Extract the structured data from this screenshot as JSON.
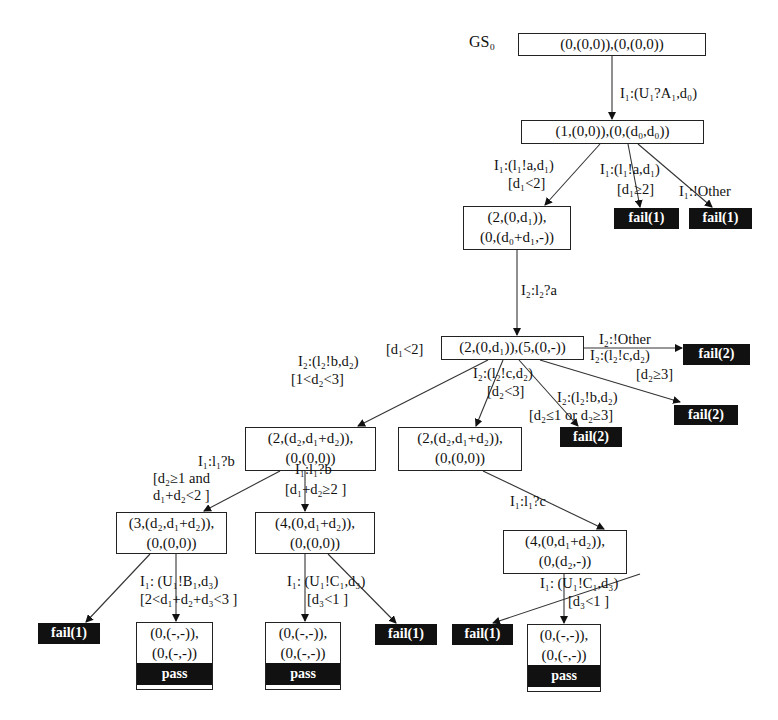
{
  "diagram": {
    "root_label": "GS₀",
    "nodes": {
      "n0": [
        "(0,(0,0)),(0,(0,0))"
      ],
      "n1": [
        "(1,(0,0)),(0,(d₀,d₀))"
      ],
      "n2": [
        "(2,(0,d₁)),",
        "(0,(d₀+d₁,-))"
      ],
      "n3": [
        "(2,(0,d₁)),(5,(0,-))"
      ],
      "n4": [
        "(2,(d₂,d₁+d₂)),",
        "(0,(0,0))"
      ],
      "n5": [
        "(2,(d₂,d₁+d₂)),",
        "(0,(0,0))"
      ],
      "n6": [
        "(3,(d₂,d₁+d₂)),",
        "(0,(0,0))"
      ],
      "n7": [
        "(4,(0,d₁+d₂)),",
        "(0,(0,0))"
      ],
      "n8": [
        "(4,(0,d₁+d₂)),",
        "(0,(d₂,-))"
      ]
    },
    "pass_nodes": [
      {
        "lines": [
          "(0,(-,-)),",
          "(0,(-,-))"
        ],
        "verdict": "pass"
      },
      {
        "lines": [
          "(0,(-,-)),",
          "(0,(-,-))"
        ],
        "verdict": "pass"
      },
      {
        "lines": [
          "(0,(-,-)),",
          "(0,(-,-))"
        ],
        "verdict": "pass"
      }
    ],
    "fail_nodes": [
      "fail(1)",
      "fail(1)",
      "fail(2)",
      "fail(2)",
      "fail(2)",
      "fail(1)",
      "fail(1)",
      "fail(1)",
      "fail(1)"
    ],
    "edge_labels": {
      "e01": "I₁:(U₁?A₁,d₀)",
      "e12_a": "I₁:(l₁!a,d₁)",
      "e12_b": "[d₁<2]",
      "e1f1_a": "I₁:(l₁!a,d₁)",
      "e1f1_b": "[d₁≥2]",
      "e1f2": "I₁:!Other",
      "e23": "I₂:l₂?a",
      "n3_guard": "[d₁<2]",
      "e3f": "I₂:!Other",
      "e34_a": "I₂:(l₂!b,d₂)",
      "e34_b": "[1<d₂<3]",
      "e35_a": "I₂:(l₂!c,d₂)",
      "e35_b": "[d₂<3]",
      "e3fm_a": "I₂:(l₂!b,d₂)",
      "e3fm_b": "[d₂≤1 or d₂≥3]",
      "e3fr_a": "I₂:(l₂!c,d₂)",
      "e3fr_b": "[d₂≥3]",
      "e46_a": "I₁:l₁?b",
      "e46_b": "[d₂≥1 and",
      "e46_c": "d₁+d₂<2 ]",
      "e47_a": "I₁:l₁?b",
      "e47_b": "[d₁+d₂≥2 ]",
      "e58": "I₁:l₁?c",
      "e6p_a": "I₁: (U₁!B₁,d₃)",
      "e6p_b": "[2<d₁+d₂+d₃<3 ]",
      "e7p_a": "I₁: (U₁!C₁,d₃)",
      "e7p_b": "[d₃<1 ]",
      "e8p_a": "I₁: (U₁!C₁,d₃)",
      "e8p_b": "[d₃<1 ]"
    }
  }
}
